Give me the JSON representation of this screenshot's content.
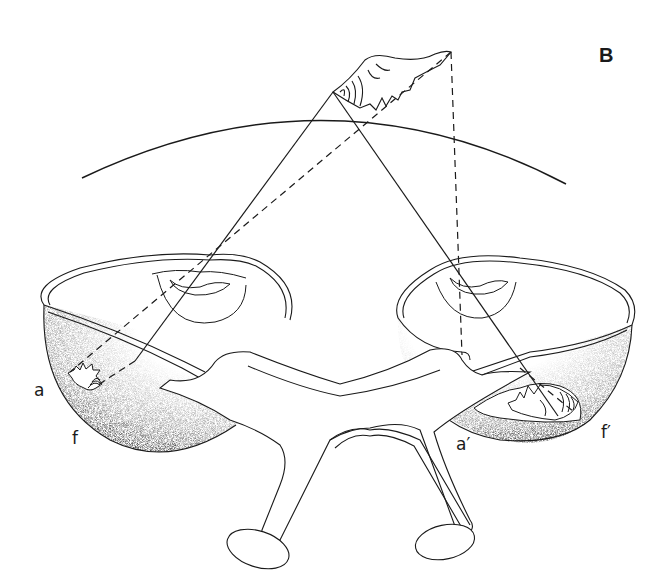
{
  "figure": {
    "panel_label": "B",
    "labels": {
      "left_a": "a",
      "left_f": "f",
      "right_a": "a′",
      "right_f": "f′"
    },
    "colors": {
      "ink": "#1a1a1a",
      "background": "#ffffff",
      "stipple": "#2a2a2a"
    },
    "elements": [
      "object-shell",
      "visual-field-arc",
      "left-eye-cup",
      "right-eye-cup",
      "optic-stalk-x",
      "left-retinal-image",
      "right-retinal-image",
      "projection-lines-solid",
      "projection-lines-dashed"
    ]
  }
}
